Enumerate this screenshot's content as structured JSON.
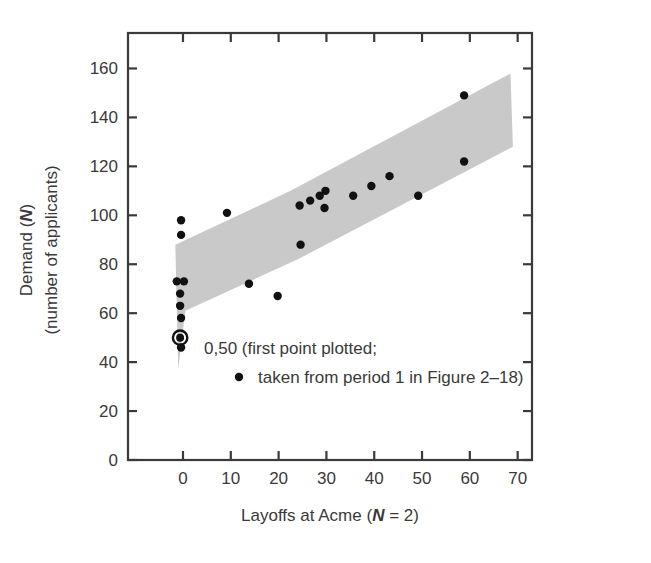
{
  "figure": {
    "background": "#ffffff",
    "frame_color": "#3a3a3a",
    "band_color": "#c9c9c9",
    "point_color": "#111111"
  },
  "chart_data": {
    "type": "scatter",
    "title": "",
    "xlabel_parts": {
      "pre": "Layoffs at Acme (",
      "italic": "N",
      "post": " = 2)"
    },
    "ylabel_line1_parts": {
      "pre": "Demand (",
      "italic": "N",
      "post": ")"
    },
    "ylabel_line2": "(number of applicants)",
    "xlabel": "Layoffs at Acme (N = 2)",
    "ylabel": "Demand (N) (number of applicants)",
    "xlim": [
      -11.5,
      73.0
    ],
    "ylim": [
      0,
      174.5
    ],
    "xticks": [
      0,
      10,
      20,
      30,
      40,
      50,
      60,
      70,
      80
    ],
    "xticklabels": [
      "0",
      "10",
      "20",
      "30",
      "40",
      "50",
      "60",
      "70",
      "80"
    ],
    "yticks": [
      0,
      20,
      40,
      60,
      80,
      100,
      120,
      140,
      160
    ],
    "yticklabels": [
      "0",
      "20",
      "40",
      "60",
      "80",
      "100",
      "120",
      "140",
      "160"
    ],
    "grid": false,
    "legend": "none",
    "tick_direction": "in",
    "frame": "box",
    "points": [
      {
        "x": -0.4,
        "y": 98,
        "highlight": false
      },
      {
        "x": -0.4,
        "y": 92,
        "highlight": false
      },
      {
        "x": -1.3,
        "y": 73,
        "highlight": false
      },
      {
        "x": 0.2,
        "y": 73,
        "highlight": false
      },
      {
        "x": -0.6,
        "y": 68,
        "highlight": false
      },
      {
        "x": -0.6,
        "y": 63,
        "highlight": false
      },
      {
        "x": -0.4,
        "y": 58,
        "highlight": false
      },
      {
        "x": -0.6,
        "y": 50,
        "highlight": true
      },
      {
        "x": -0.4,
        "y": 46,
        "highlight": false
      },
      {
        "x": 9.2,
        "y": 101,
        "highlight": false
      },
      {
        "x": 13.8,
        "y": 72,
        "highlight": false
      },
      {
        "x": 19.8,
        "y": 67,
        "highlight": false
      },
      {
        "x": 24.4,
        "y": 104,
        "highlight": false
      },
      {
        "x": 24.6,
        "y": 88,
        "highlight": false
      },
      {
        "x": 26.6,
        "y": 106,
        "highlight": false
      },
      {
        "x": 28.6,
        "y": 108,
        "highlight": false
      },
      {
        "x": 29.8,
        "y": 110,
        "highlight": false
      },
      {
        "x": 29.6,
        "y": 103,
        "highlight": false
      },
      {
        "x": 35.6,
        "y": 108,
        "highlight": false
      },
      {
        "x": 39.4,
        "y": 112,
        "highlight": false
      },
      {
        "x": 43.2,
        "y": 116,
        "highlight": false
      },
      {
        "x": 49.2,
        "y": 108,
        "highlight": false
      },
      {
        "x": 58.8,
        "y": 149,
        "highlight": false
      },
      {
        "x": 58.8,
        "y": 122,
        "highlight": false
      }
    ],
    "band_polygon_data": [
      {
        "x": -1.6,
        "y": 88
      },
      {
        "x": 22.5,
        "y": 110
      },
      {
        "x": 68.5,
        "y": 158
      },
      {
        "x": 69.0,
        "y": 128
      },
      {
        "x": 24.0,
        "y": 82
      },
      {
        "x": 0.5,
        "y": 61
      },
      {
        "x": -1.0,
        "y": 37
      }
    ],
    "annotations": [
      {
        "name": "first-point-callout",
        "line1": "0,50 (first point plotted;",
        "line2": "taken from period 1 in Figure 2–18)",
        "marker_on_line2": true
      }
    ]
  }
}
